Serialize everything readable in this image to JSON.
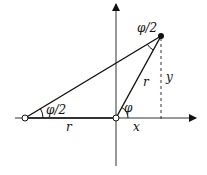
{
  "diagram": {
    "axes": {
      "x_axis": true,
      "y_axis": true
    },
    "points": {
      "origin": {
        "style": "open-circle"
      },
      "left_point": {
        "style": "open-circle"
      },
      "point_p": {
        "style": "filled-circle"
      }
    },
    "labels": {
      "half_angle_top": "φ/2",
      "half_angle_left": "φ/2",
      "angle_phi": "φ",
      "radius_slant": "r",
      "radius_base": "r",
      "x_label": "x",
      "y_label": "y"
    },
    "colors": {
      "stroke": "#111111",
      "background": "#ffffff",
      "axis": "#333333"
    }
  }
}
